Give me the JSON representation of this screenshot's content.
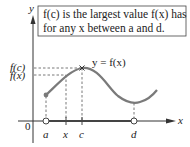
{
  "caption": {
    "line1": "f(c) is the largest value f(x) has",
    "line2": "for any x between a and d."
  },
  "curve_label": "y = f(x)",
  "axes": {
    "y_label": "y",
    "x_label": "x",
    "origin_label": "0"
  },
  "y_ticks": [
    {
      "label": "f(c)"
    },
    {
      "label": "f(x)"
    }
  ],
  "x_ticks": [
    {
      "label": "a"
    },
    {
      "label": "x"
    },
    {
      "label": "c"
    },
    {
      "label": "d"
    }
  ],
  "colors": {
    "curve": "#7a7a7a",
    "axis": "#333333",
    "dash": "#555555"
  }
}
